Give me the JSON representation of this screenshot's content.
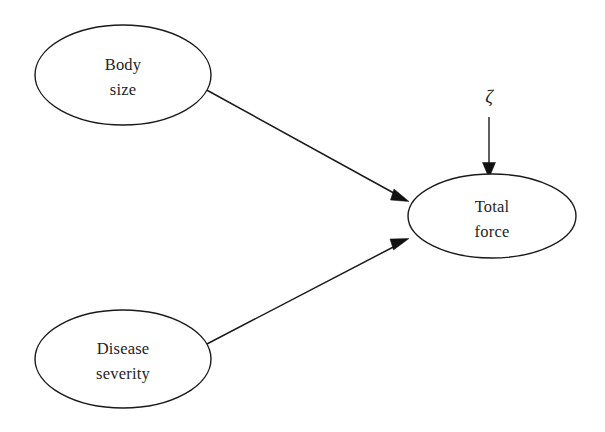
{
  "diagram": {
    "kind": "path-diagram",
    "background_color": "#ffffff",
    "stroke_color": "#1a1a1a",
    "text_color": "#242424",
    "nodes": [
      {
        "id": "body-size",
        "label_line1": "Body",
        "label_line2": "size",
        "shape": "ellipse",
        "cx": 123,
        "cy": 75,
        "rx": 88,
        "ry": 50
      },
      {
        "id": "disease-severity",
        "label_line1": "Disease",
        "label_line2": "severity",
        "shape": "ellipse",
        "cx": 123,
        "cy": 359,
        "rx": 88,
        "ry": 49
      },
      {
        "id": "total-force",
        "label_line1": "Total",
        "label_line2": "force",
        "shape": "ellipse",
        "cx": 492,
        "cy": 216,
        "rx": 84,
        "ry": 42
      }
    ],
    "edges": [
      {
        "id": "body-size-to-total-force",
        "from": "body-size",
        "to": "total-force",
        "type": "directed",
        "x1": 203,
        "y1": 88,
        "x2": 408,
        "y2": 201
      },
      {
        "id": "disease-severity-to-total-force",
        "from": "disease-severity",
        "to": "total-force",
        "type": "directed",
        "x1": 205,
        "y1": 345,
        "x2": 408,
        "y2": 239
      },
      {
        "id": "disturbance-to-total-force",
        "from": "disturbance",
        "to": "total-force",
        "type": "directed",
        "x1": 489,
        "y1": 117,
        "x2": 489,
        "y2": 177
      }
    ],
    "disturbance": {
      "id": "disturbance-zeta",
      "symbol": "ζ",
      "x": 489,
      "y": 103
    }
  }
}
